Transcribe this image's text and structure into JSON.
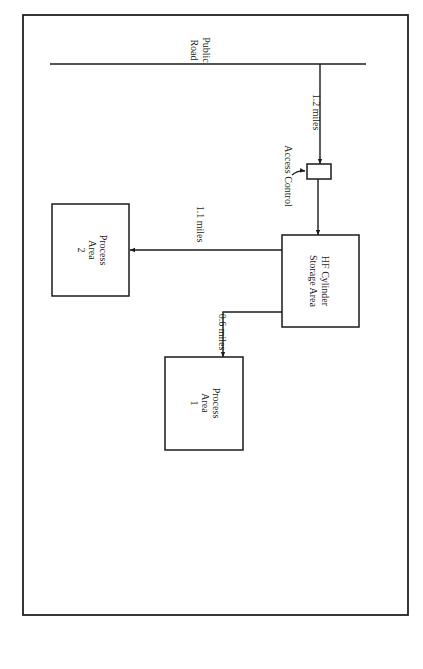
{
  "diagram": {
    "road": {
      "label_line1": "Public",
      "label_line2": "Road"
    },
    "access_control": {
      "label": "Access Control"
    },
    "storage": {
      "line1": "HF Cylinder",
      "line2": "Storage Area"
    },
    "process_area_1": {
      "line1": "Process",
      "line2": "Area",
      "line3": "1"
    },
    "process_area_2": {
      "line1": "Process",
      "line2": "Area",
      "line3": "2"
    },
    "distances": {
      "road_to_storage": "1.2 miles",
      "storage_to_pa2": "1.1 miles",
      "storage_to_pa1": "0.6 miles"
    },
    "colors": {
      "line": "#1a1a1a",
      "background": "#ffffff"
    }
  }
}
